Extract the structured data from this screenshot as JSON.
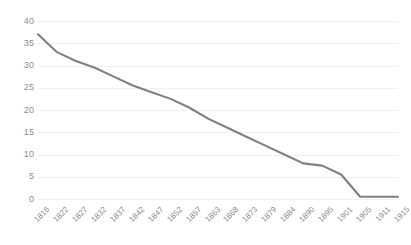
{
  "chart_data": {
    "type": "line",
    "title": "",
    "xlabel": "",
    "ylabel": "",
    "categories": [
      "1816",
      "1822",
      "1827",
      "1832",
      "1837",
      "1842",
      "1847",
      "1852",
      "1857",
      "1863",
      "1868",
      "1873",
      "1879",
      "1884",
      "1890",
      "1895",
      "1901",
      "1905",
      "1911",
      "1915"
    ],
    "values": [
      37,
      33,
      31,
      29.5,
      27.5,
      25.5,
      24,
      22.5,
      20.5,
      18,
      16,
      14,
      12,
      10,
      8,
      7.5,
      5.5,
      0.5,
      0.5,
      0.5
    ],
    "series": [
      {
        "name": "Series 1",
        "values": [
          37,
          33,
          31,
          29.5,
          27.5,
          25.5,
          24,
          22.5,
          20.5,
          18,
          16,
          14,
          12,
          10,
          8,
          7.5,
          5.5,
          0.5,
          0.5,
          0.5
        ]
      }
    ],
    "ytick_labels": [
      "0",
      "5",
      "10",
      "15",
      "20",
      "25",
      "30",
      "35",
      "40"
    ],
    "ytick_values": [
      0,
      5,
      10,
      15,
      20,
      25,
      30,
      35,
      40
    ],
    "ylim": [
      0,
      40
    ],
    "grid": true,
    "grid_axis": "y",
    "legend": false,
    "legend_position": "none",
    "line_color": "#808080",
    "grid_color": "#eff0f1",
    "tick_label_color": "#8d8d8d",
    "background_color": "#ffffff",
    "xtick_rotation": -45
  }
}
